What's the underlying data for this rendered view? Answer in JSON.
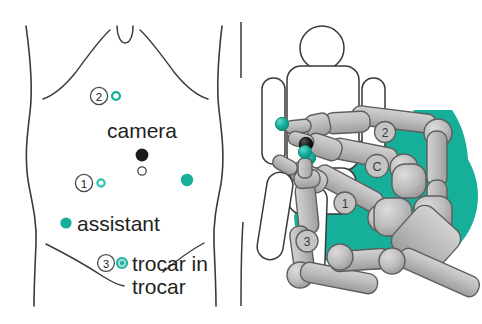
{
  "figure": {
    "background_color": "#ffffff",
    "width": 482,
    "height": 324
  },
  "colors": {
    "teal": "#16b09a",
    "teal_light": "#5fcfc2",
    "black_marker": "#1a1a1a",
    "outline": "#3a3a3a",
    "robot_gray": "#b8b8b8",
    "robot_gray_dark": "#9a9a9a",
    "robot_outline": "#5e5e5e",
    "text": "#231f20"
  },
  "left_panel": {
    "name": "abdominal-port-map",
    "labels": {
      "camera": "camera",
      "assistant": "assistant",
      "trocar_line1": "trocar in",
      "trocar_line2": "trocar"
    },
    "port_markers": [
      {
        "id": "2",
        "number": "2",
        "type": "ring-number",
        "marker": "small-teal-ring",
        "x": 99,
        "y": 96
      },
      {
        "id": "1",
        "number": "1",
        "type": "ring-number",
        "marker": "small-teal-ring",
        "x": 84,
        "y": 183
      },
      {
        "id": "3",
        "number": "3",
        "type": "ring-number",
        "marker": "teal-double-ring",
        "x": 106,
        "y": 263
      },
      {
        "id": "camera",
        "number": "",
        "type": "solid-dot",
        "marker": "black-dot",
        "x": 142,
        "y": 155
      },
      {
        "id": "umbilicus",
        "number": "",
        "type": "open-circle",
        "marker": "umbilicus",
        "x": 142,
        "y": 171
      },
      {
        "id": "assistant-left",
        "number": "",
        "type": "solid-dot",
        "marker": "teal-dot",
        "x": 66,
        "y": 223
      },
      {
        "id": "right-port",
        "number": "",
        "type": "solid-dot",
        "marker": "teal-dot",
        "x": 187,
        "y": 180
      }
    ]
  },
  "right_panel": {
    "name": "robot-docking-diagram",
    "patient": {
      "name": "patient-figure",
      "pose": "supine"
    },
    "arm_labels": [
      {
        "id": "arm-2",
        "label": "2"
      },
      {
        "id": "arm-camera",
        "label": "C"
      },
      {
        "id": "arm-1",
        "label": "1"
      },
      {
        "id": "arm-3",
        "label": "3"
      }
    ],
    "instrument_tips": [
      {
        "id": "tip-arm-2",
        "color": "teal"
      },
      {
        "id": "tip-camera",
        "color": "black"
      },
      {
        "id": "tip-arm-1",
        "color": "teal"
      },
      {
        "id": "tip-arm-3",
        "color": "teal"
      }
    ]
  }
}
